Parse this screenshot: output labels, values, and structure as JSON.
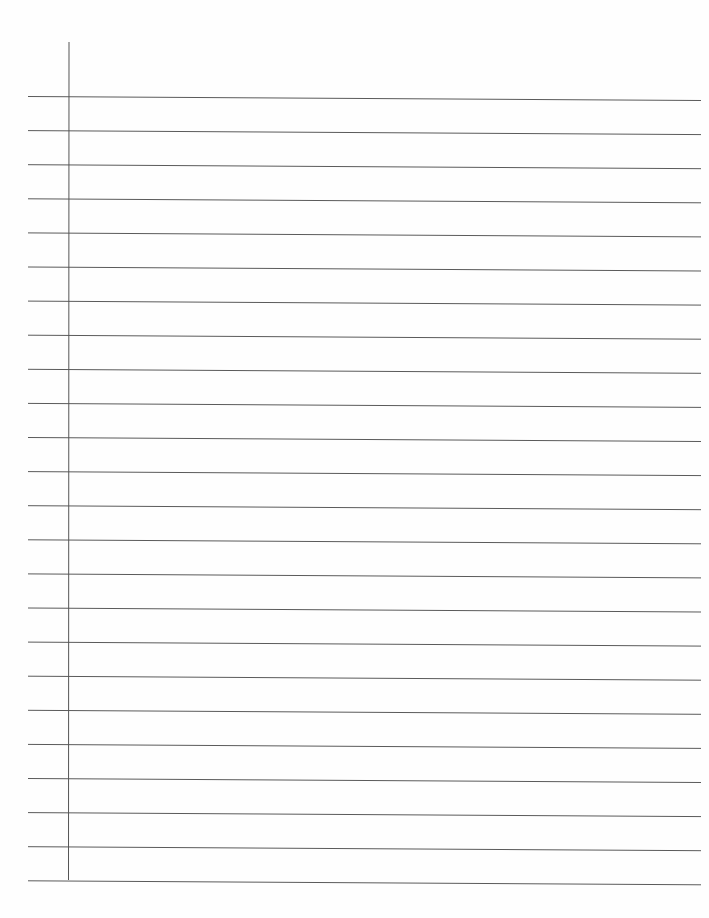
{
  "document": {
    "type": "lined-paper",
    "ruled_line_count": 24,
    "has_margin_line": true,
    "line_color": "#5a5a5a",
    "margin_line_color": "#555555",
    "paper_color": "#fefefe",
    "text_content": ""
  }
}
